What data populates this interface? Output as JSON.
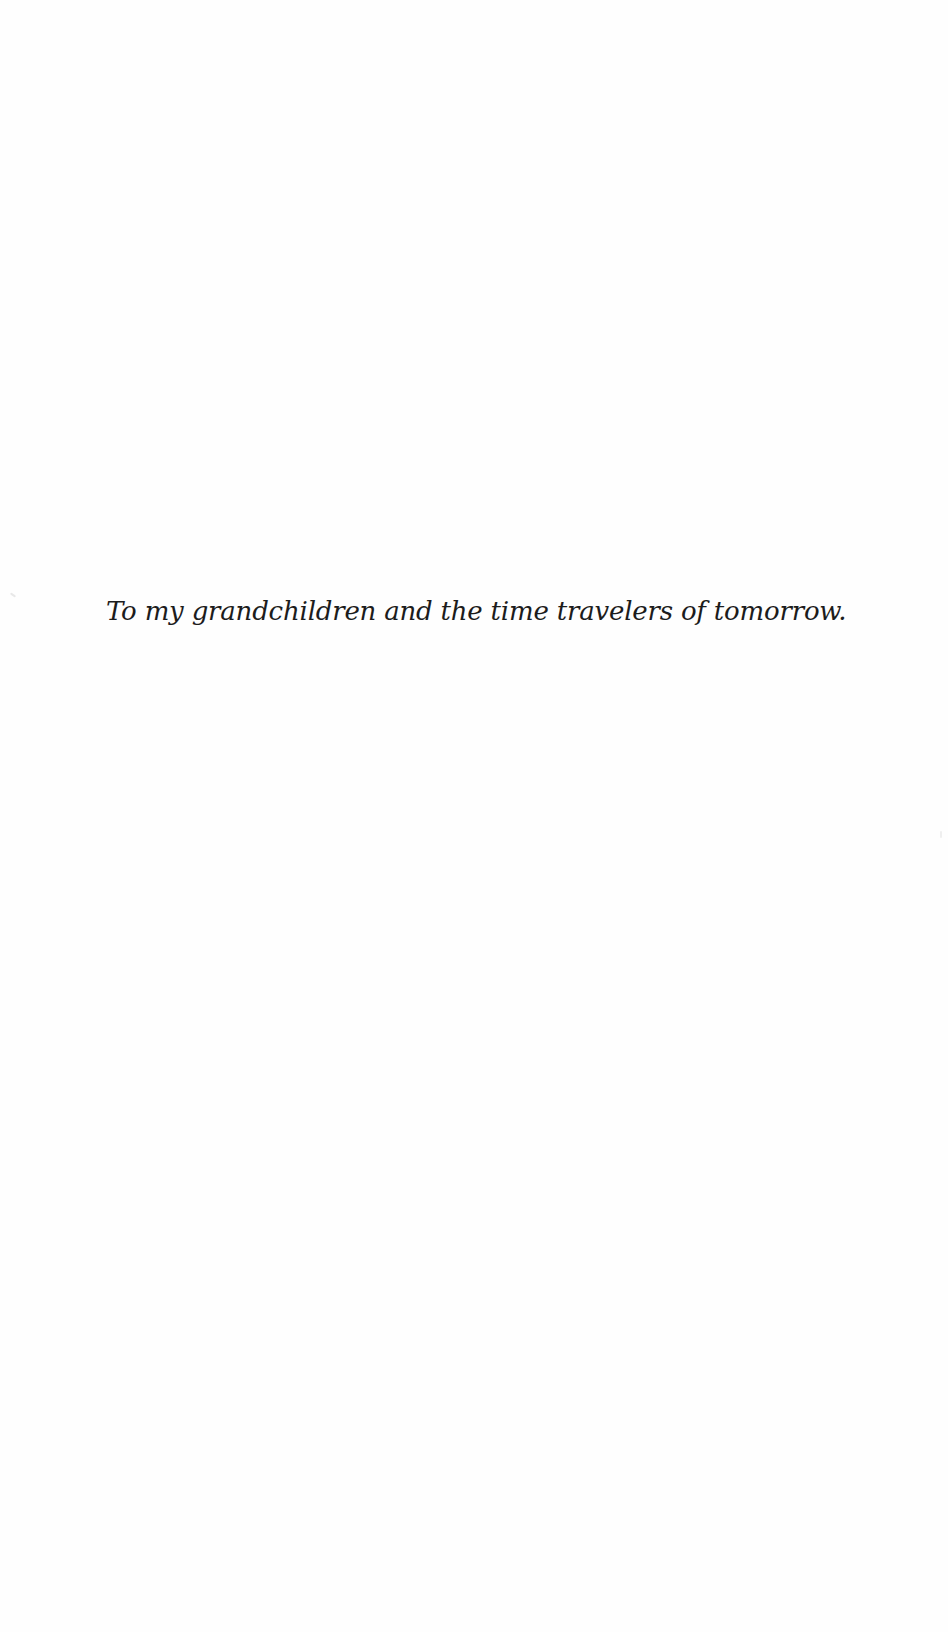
{
  "page": {
    "type": "dedication",
    "background_color": "#fefefe",
    "text_color": "#1c1c1c"
  },
  "dedication": {
    "text": "To my grandchildren and the time travelers of tomorrow."
  }
}
